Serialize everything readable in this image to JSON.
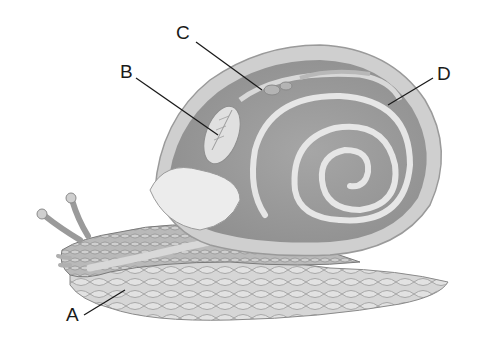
{
  "diagram": {
    "labels": [
      {
        "id": "A",
        "text": "A",
        "points_to": "foot / head region",
        "x": 66,
        "y": 307,
        "line": [
          84,
          315,
          125,
          290
        ]
      },
      {
        "id": "B",
        "text": "B",
        "points_to": "lung / gill (mantle cavity organ)",
        "x": 120,
        "y": 64,
        "line": [
          136,
          78,
          218,
          135
        ]
      },
      {
        "id": "C",
        "text": "C",
        "points_to": "heart",
        "x": 176,
        "y": 25,
        "line": [
          196,
          42,
          262,
          90
        ]
      },
      {
        "id": "D",
        "text": "D",
        "points_to": "shell",
        "x": 437,
        "y": 66,
        "line": [
          433,
          78,
          388,
          105
        ]
      }
    ]
  },
  "colors": {
    "background": "#ffffff",
    "shell_outer": "#c9c9c9",
    "shell_inner": "#9a9a9a",
    "spiral": "#e4e4e4",
    "body": "#a8a8a8",
    "foot": "#c8c8c8",
    "label_line": "#1a1a1a"
  }
}
